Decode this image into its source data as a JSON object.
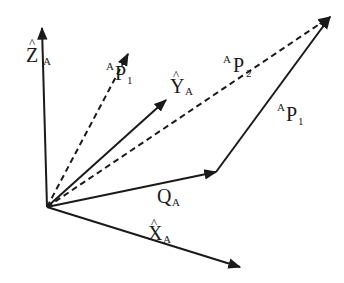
{
  "diagram": {
    "title": "",
    "frame": "A",
    "colors": {
      "stroke": "#1a1a1a",
      "background": "#ffffff"
    },
    "origin": {
      "x": 47,
      "y": 207
    },
    "vectors": [
      {
        "id": "Z_A",
        "style": "solid",
        "from": [
          47,
          207
        ],
        "to": [
          42,
          27
        ]
      },
      {
        "id": "X_A",
        "style": "solid",
        "from": [
          47,
          207
        ],
        "to": [
          240,
          267
        ]
      },
      {
        "id": "Y_A",
        "style": "solid",
        "from": [
          47,
          207
        ],
        "to": [
          166,
          100
        ]
      },
      {
        "id": "Q_A",
        "style": "solid",
        "from": [
          47,
          207
        ],
        "to": [
          216,
          172
        ]
      },
      {
        "id": "AP1_dashed",
        "style": "dashed",
        "from": [
          47,
          207
        ],
        "to": [
          128,
          54
        ]
      },
      {
        "id": "AP2",
        "style": "dashed",
        "from": [
          47,
          207
        ],
        "to": [
          330,
          17
        ]
      },
      {
        "id": "AP1_solid",
        "style": "solid",
        "from": [
          216,
          172
        ],
        "to": [
          330,
          17
        ]
      }
    ],
    "labels": {
      "z_axis": {
        "hat": "^",
        "main": "Z",
        "sub": "A"
      },
      "x_axis": {
        "hat": "^",
        "main": "X",
        "sub": "A"
      },
      "y_axis": {
        "hat": "^",
        "main": "Y",
        "sub": "A"
      },
      "q": {
        "main": "Q",
        "sub": "A"
      },
      "p1_left": {
        "sup": "A",
        "main": "P",
        "sub": "1"
      },
      "p2": {
        "sup": "A",
        "main": "P",
        "sub": "2"
      },
      "p1_right": {
        "sup": "A",
        "main": "P",
        "sub": "1"
      }
    }
  }
}
